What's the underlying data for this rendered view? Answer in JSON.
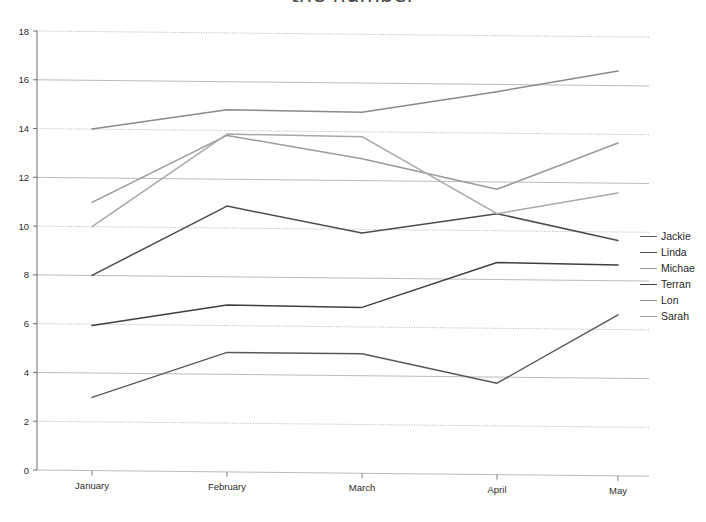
{
  "title": {
    "text": "the number",
    "note": "title clipped at top edge of screenshot"
  },
  "legend": {
    "position": "right",
    "items": [
      {
        "label": "Jackie",
        "color": "#595959"
      },
      {
        "label": "Linda",
        "color": "#4d4d4d"
      },
      {
        "label": "Michae",
        "color": "#9a9a9a"
      },
      {
        "label": "Terran",
        "color": "#3f3f3f"
      },
      {
        "label": "Lon",
        "color": "#8a8a8a"
      },
      {
        "label": "Sarah",
        "color": "#a8a8a8"
      }
    ]
  },
  "axes": {
    "y_ticks": [
      0,
      2,
      4,
      6,
      8,
      10,
      12,
      14,
      16,
      18
    ],
    "x_ticks": [
      "January",
      "February",
      "March",
      "April",
      "May"
    ]
  },
  "chart_data": {
    "type": "line",
    "title": "the number",
    "xlabel": "",
    "ylabel": "",
    "categories": [
      "January",
      "February",
      "March",
      "April",
      "May"
    ],
    "ylim": [
      0,
      18
    ],
    "xlim": [
      0,
      4
    ],
    "grid": true,
    "legend_position": "right",
    "series": [
      {
        "name": "Jackie",
        "color": "#595959",
        "values": [
          3.0,
          4.9,
          4.9,
          3.75,
          6.6
        ]
      },
      {
        "name": "Linda",
        "color": "#4d4d4d",
        "values": [
          8.0,
          10.9,
          9.85,
          10.7,
          9.65
        ]
      },
      {
        "name": "Michae",
        "color": "#9a9a9a",
        "values": [
          11.0,
          13.8,
          12.9,
          11.7,
          13.65
        ]
      },
      {
        "name": "Terran",
        "color": "#3f3f3f",
        "values": [
          5.95,
          6.85,
          6.8,
          8.7,
          8.65
        ]
      },
      {
        "name": "Lon",
        "color": "#8a8a8a",
        "values": [
          14.0,
          14.85,
          14.8,
          15.7,
          16.6
        ]
      },
      {
        "name": "Sarah",
        "color": "#a8a8a8",
        "values": [
          10.0,
          13.85,
          13.8,
          10.7,
          11.6
        ]
      }
    ]
  }
}
